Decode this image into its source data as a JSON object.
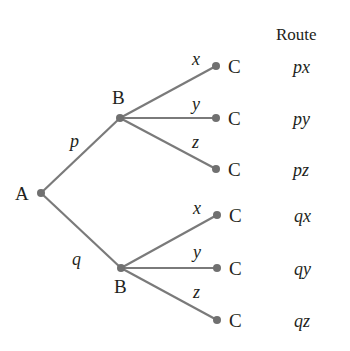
{
  "diagram": {
    "type": "tree",
    "colors": {
      "edge": "#7a7a7a",
      "node": "#707070",
      "text": "#231f20",
      "background": "#ffffff"
    },
    "root": {
      "label": "A"
    },
    "level1": [
      {
        "label": "B",
        "edge_label": "p"
      },
      {
        "label": "B",
        "edge_label": "q"
      }
    ],
    "level2_edge_labels": [
      "x",
      "y",
      "z"
    ],
    "leaf_label": "C",
    "route_header": "Route",
    "routes": [
      "px",
      "py",
      "pz",
      "qx",
      "qy",
      "qz"
    ],
    "leaves": [
      {
        "label": "C",
        "edge_label": "x",
        "route": "px"
      },
      {
        "label": "C",
        "edge_label": "y",
        "route": "py"
      },
      {
        "label": "C",
        "edge_label": "z",
        "route": "pz"
      },
      {
        "label": "C",
        "edge_label": "x",
        "route": "qx"
      },
      {
        "label": "C",
        "edge_label": "y",
        "route": "qy"
      },
      {
        "label": "C",
        "edge_label": "z",
        "route": "qz"
      }
    ]
  }
}
